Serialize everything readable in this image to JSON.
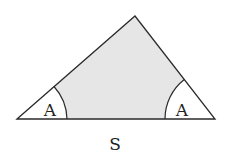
{
  "diagram": {
    "shape": "triangle",
    "fill_color": "#e6e6e6",
    "stroke_color": "#2a2a2a",
    "background": "#ffffff",
    "vertices": {
      "left": [
        17,
        119
      ],
      "apex": [
        135,
        16
      ],
      "right": [
        215,
        119
      ]
    },
    "angle_labels": [
      {
        "text": "A",
        "position": "left-base-angle"
      },
      {
        "text": "A",
        "position": "right-base-angle"
      }
    ],
    "side_label": {
      "text": "S",
      "position": "base"
    }
  }
}
